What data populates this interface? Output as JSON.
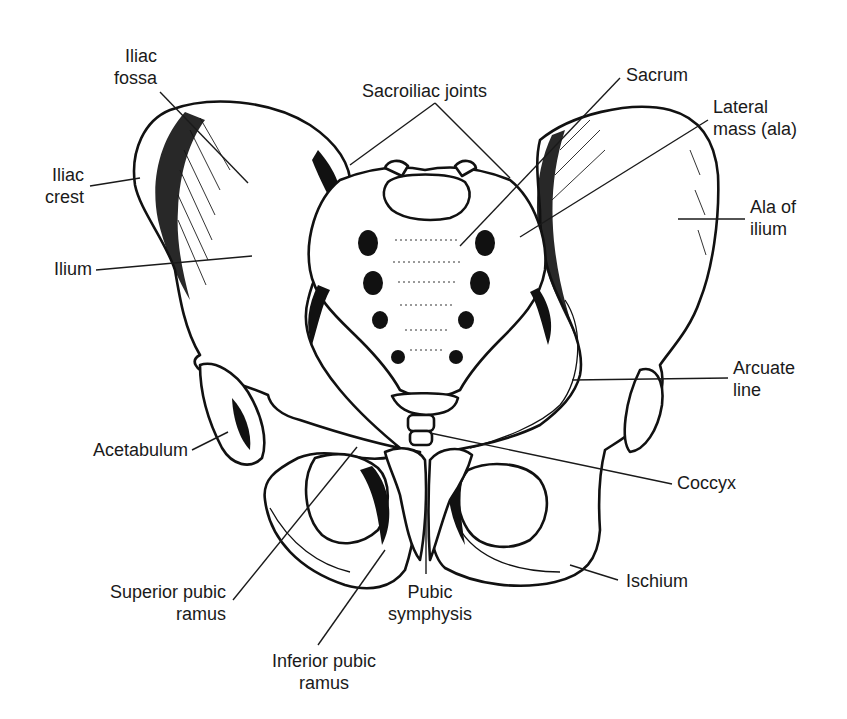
{
  "figure": {
    "background": "#ffffff",
    "line_color": "#111111",
    "labels": [
      {
        "id": "iliac-fossa",
        "text": "Iliac\nfossa",
        "x": 105,
        "y": 45,
        "align": "right",
        "w": 52
      },
      {
        "id": "sacroiliac-joints",
        "text": "Sacroiliac joints",
        "x": 362,
        "y": 80,
        "align": "left",
        "w": 150
      },
      {
        "id": "sacrum",
        "text": "Sacrum",
        "x": 626,
        "y": 64,
        "align": "left",
        "w": 80
      },
      {
        "id": "lateral-mass",
        "text": "Lateral\nmass (ala)",
        "x": 713,
        "y": 96,
        "align": "left",
        "w": 110
      },
      {
        "id": "iliac-crest",
        "text": "Iliac\ncrest",
        "x": 36,
        "y": 164,
        "align": "right",
        "w": 48
      },
      {
        "id": "ala-of-ilium",
        "text": "Ala of\nilium",
        "x": 750,
        "y": 196,
        "align": "left",
        "w": 70
      },
      {
        "id": "ilium",
        "text": "Ilium",
        "x": 46,
        "y": 258,
        "align": "right",
        "w": 46
      },
      {
        "id": "arcuate-line",
        "text": "Arcuate\nline",
        "x": 733,
        "y": 357,
        "align": "left",
        "w": 80
      },
      {
        "id": "acetabulum",
        "text": "Acetabulum",
        "x": 78,
        "y": 439,
        "align": "right",
        "w": 110
      },
      {
        "id": "coccyx",
        "text": "Coccyx",
        "x": 677,
        "y": 472,
        "align": "left",
        "w": 80
      },
      {
        "id": "ischium",
        "text": "Ischium",
        "x": 626,
        "y": 570,
        "align": "left",
        "w": 80
      },
      {
        "id": "superior-pubic-ramus",
        "text": "Superior pubic\n    ramus",
        "x": 92,
        "y": 581,
        "align": "right",
        "w": 134
      },
      {
        "id": "pubic-symphysis",
        "text": "Pubic\nsymphysis",
        "x": 380,
        "y": 581,
        "align": "center",
        "w": 100
      },
      {
        "id": "inferior-pubic-ramus",
        "text": "Inferior pubic\nramus",
        "x": 258,
        "y": 650,
        "align": "center",
        "w": 132
      }
    ]
  }
}
